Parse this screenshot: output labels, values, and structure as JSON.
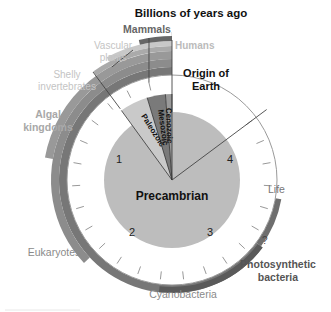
{
  "title": "Billions of years ago",
  "center_label": "Precambrian",
  "era_labels": {
    "paleozoic": "Paleozoic",
    "mesozoic": "Mesozoic",
    "cenozoic": "Cenozoic"
  },
  "tick_numbers": [
    "1",
    "2",
    "3",
    "4"
  ],
  "origin_label_line1": "Origin of",
  "origin_label_line2": "Earth",
  "total_billion_years": 4.6,
  "eras_billion_years_ago": {
    "paleozoic_start": 0.541,
    "mesozoic_start": 0.252,
    "cenozoic_start": 0.066
  },
  "life_bands": [
    {
      "label": "Humans",
      "start_bya": 0.002,
      "color": "#b8b8b8"
    },
    {
      "label": "Mammals",
      "start_bya": 0.2,
      "color": "#666666"
    },
    {
      "label_line1": "Vascular",
      "label_line2": "plants",
      "start_bya": 0.42,
      "color": "#c8c8c8"
    },
    {
      "label_line1": "Shelly",
      "label_line2": "invertebrates",
      "start_bya": 0.54,
      "color": "#aaaaaa"
    },
    {
      "label_line1": "Algal",
      "label_line2": "kingdoms",
      "start_bya": 1.2,
      "color": "#999999"
    },
    {
      "label": "Eukaryotes",
      "start_bya": 2.0,
      "color": "#8c8c8c"
    },
    {
      "label": "Cyanobacteria",
      "start_bya": 3.5,
      "color": "#777777"
    },
    {
      "label_line1": "Photosynthetic",
      "label_line2": "bacteria",
      "start_bya": 3.5,
      "color": "#5a5a5a"
    },
    {
      "label": "Life",
      "start_bya": 3.9,
      "color": "#6e6e6e"
    }
  ],
  "question_mark": "?",
  "colors": {
    "disc": "#bdbdbd",
    "title_text": "#111111",
    "label_light": "#bbbbbb",
    "label_mid": "#8a8a8a",
    "label_dark": "#555555"
  }
}
